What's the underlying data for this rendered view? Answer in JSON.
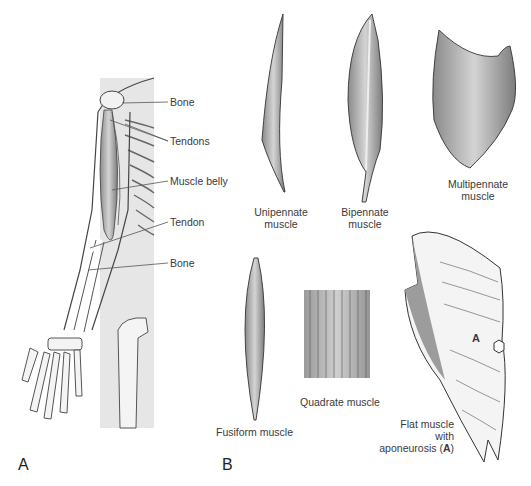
{
  "panels": {
    "a": {
      "letter": "A",
      "labels": {
        "bone_top": "Bone",
        "tendons": "Tendons",
        "muscle_belly": "Muscle belly",
        "tendon": "Tendon",
        "bone_bottom": "Bone"
      }
    },
    "b": {
      "letter": "B",
      "muscles": {
        "unipennate": [
          "Unipennate",
          "muscle"
        ],
        "bipennate": [
          "Bipennate",
          "muscle"
        ],
        "multipennate": [
          "Multipennate",
          "muscle"
        ],
        "fusiform": "Fusiform muscle",
        "quadrate": "Quadrate muscle",
        "flat": [
          "Flat muscle",
          "with",
          "aponeurosis (",
          "A",
          ")"
        ],
        "aponeurosis_marker": "A"
      }
    }
  },
  "colors": {
    "background": "#ffffff",
    "torso_shade": "#e6e6e6",
    "muscle_dark": "#7a7a7a",
    "muscle_mid": "#b0b0b0",
    "outline": "#3a3a3a"
  }
}
